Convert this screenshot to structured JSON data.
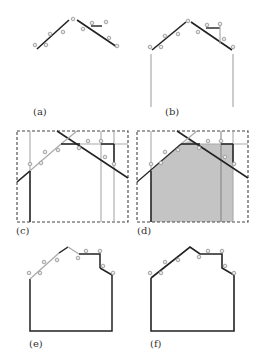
{
  "figure": {
    "panels": [
      {
        "id": "a",
        "label": "(a)"
      },
      {
        "id": "b",
        "label": "(b)"
      },
      {
        "id": "c",
        "label": "(c)"
      },
      {
        "id": "d",
        "label": "(d)"
      },
      {
        "id": "e",
        "label": "(e)"
      },
      {
        "id": "f",
        "label": "(f)"
      }
    ],
    "colors": {
      "dark_line": "#222222",
      "gray_line": "#9a9a9a",
      "point": "#9a9a9a",
      "fill": "#c4c4c4",
      "dashed_box": "#444444"
    }
  }
}
